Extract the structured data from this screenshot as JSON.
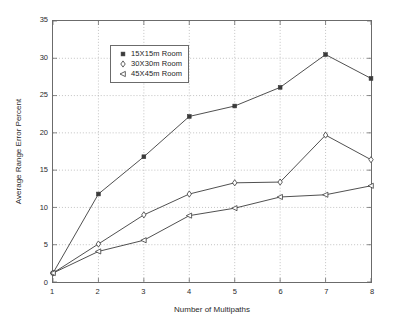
{
  "chart_data": {
    "type": "line",
    "title": "",
    "xlabel": "Number of Multipaths",
    "ylabel": "Average Range Error Percent",
    "x": [
      1,
      2,
      3,
      4,
      5,
      6,
      7,
      8
    ],
    "xlim": [
      1,
      8
    ],
    "ylim": [
      0,
      35
    ],
    "xticks": [
      "1",
      "2",
      "3",
      "4",
      "5",
      "6",
      "7",
      "8"
    ],
    "yticks": [
      "0",
      "5",
      "10",
      "15",
      "20",
      "25",
      "30",
      "35"
    ],
    "grid": true,
    "grid_style": "dotted",
    "legend_position": "top-left",
    "line_color": "#3a3a3a",
    "series": [
      {
        "name": "15X15m Room",
        "marker": "filled-square",
        "values": [
          1.2,
          11.8,
          16.8,
          22.2,
          23.6,
          26.1,
          30.5,
          27.3
        ]
      },
      {
        "name": "30X30m Room",
        "marker": "diamond",
        "values": [
          1.2,
          5.1,
          9.0,
          11.8,
          13.3,
          13.4,
          19.7,
          16.4
        ]
      },
      {
        "name": "45X45m Room",
        "marker": "left-triangle",
        "values": [
          1.2,
          4.1,
          5.6,
          8.9,
          9.9,
          11.4,
          11.7,
          12.9
        ]
      }
    ]
  }
}
